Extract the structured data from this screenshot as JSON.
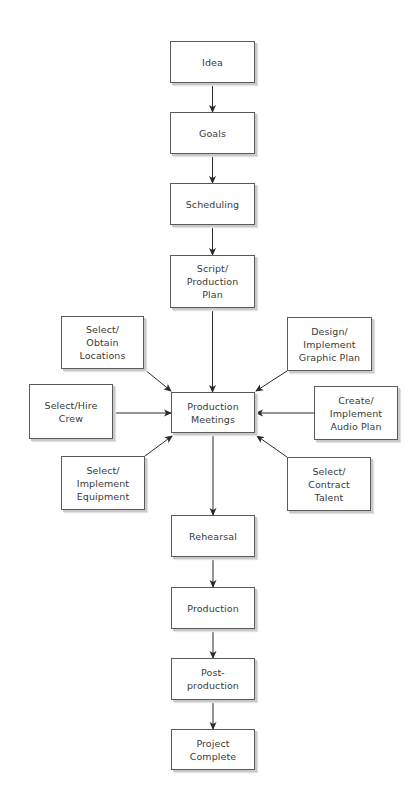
{
  "diagram": {
    "type": "flowchart",
    "colors": {
      "background": "#ffffff",
      "box_border": "#5a5a5a",
      "box_shadow": "#c9c9c9",
      "arrow": "#2a2a2a",
      "text": "#3a3a3a"
    },
    "main_flow": [
      {
        "id": "idea",
        "label": "Idea",
        "x": 170,
        "y": 41,
        "w": 85,
        "h": 42
      },
      {
        "id": "goals",
        "label": "Goals",
        "x": 170,
        "y": 112,
        "w": 85,
        "h": 42
      },
      {
        "id": "scheduling",
        "label": "Scheduling",
        "x": 170,
        "y": 183,
        "w": 85,
        "h": 42
      },
      {
        "id": "script",
        "label": "Script/\nProduction\nPlan",
        "x": 170,
        "y": 255,
        "w": 85,
        "h": 53
      },
      {
        "id": "meetings",
        "label": "Production\nMeetings",
        "x": 171,
        "y": 392,
        "w": 84,
        "h": 41
      },
      {
        "id": "rehearsal",
        "label": "Rehearsal",
        "x": 171,
        "y": 515,
        "w": 84,
        "h": 42
      },
      {
        "id": "production",
        "label": "Production",
        "x": 171,
        "y": 587,
        "w": 84,
        "h": 42
      },
      {
        "id": "postproduction",
        "label": "Post-\nproduction",
        "x": 171,
        "y": 658,
        "w": 84,
        "h": 42
      },
      {
        "id": "complete",
        "label": "Project\nComplete",
        "x": 171,
        "y": 729,
        "w": 84,
        "h": 41
      }
    ],
    "inputs": [
      {
        "id": "locations",
        "label": "Select/\nObtain\nLocations",
        "x": 61,
        "y": 316,
        "w": 83,
        "h": 53
      },
      {
        "id": "crew",
        "label": "Select/Hire\nCrew",
        "x": 29,
        "y": 384,
        "w": 84,
        "h": 55
      },
      {
        "id": "equipment",
        "label": "Select/\nImplement\nEquipment",
        "x": 61,
        "y": 456,
        "w": 84,
        "h": 54
      },
      {
        "id": "graphic",
        "label": "Design/\nImplement\nGraphic Plan",
        "x": 287,
        "y": 317,
        "w": 85,
        "h": 54
      },
      {
        "id": "audio",
        "label": "Create/\nImplement\nAudio Plan",
        "x": 314,
        "y": 386,
        "w": 84,
        "h": 54
      },
      {
        "id": "talent",
        "label": "Select/\nContract\nTalent",
        "x": 287,
        "y": 457,
        "w": 84,
        "h": 54
      }
    ],
    "edges": [
      {
        "from": "idea",
        "to": "goals",
        "x1": 212.5,
        "y1": 83,
        "x2": 212.5,
        "y2": 112
      },
      {
        "from": "goals",
        "to": "scheduling",
        "x1": 212.5,
        "y1": 154,
        "x2": 212.5,
        "y2": 183
      },
      {
        "from": "scheduling",
        "to": "script",
        "x1": 212.5,
        "y1": 225,
        "x2": 212.5,
        "y2": 255
      },
      {
        "from": "script",
        "to": "meetings",
        "x1": 212.5,
        "y1": 308,
        "x2": 212.5,
        "y2": 392
      },
      {
        "from": "locations",
        "to": "meetings",
        "x1": 144,
        "y1": 369,
        "x2": 171,
        "y2": 391
      },
      {
        "from": "crew",
        "to": "meetings",
        "x1": 113,
        "y1": 413,
        "x2": 171,
        "y2": 413
      },
      {
        "from": "equipment",
        "to": "meetings",
        "x1": 145,
        "y1": 456,
        "x2": 172,
        "y2": 436
      },
      {
        "from": "graphic",
        "to": "meetings",
        "x1": 287,
        "y1": 371,
        "x2": 256,
        "y2": 391
      },
      {
        "from": "audio",
        "to": "meetings",
        "x1": 314,
        "y1": 413,
        "x2": 256,
        "y2": 413
      },
      {
        "from": "talent",
        "to": "meetings",
        "x1": 287,
        "y1": 457,
        "x2": 257,
        "y2": 436
      },
      {
        "from": "meetings",
        "to": "rehearsal",
        "x1": 213,
        "y1": 433,
        "x2": 213,
        "y2": 515
      },
      {
        "from": "rehearsal",
        "to": "production",
        "x1": 213,
        "y1": 557,
        "x2": 213,
        "y2": 587
      },
      {
        "from": "production",
        "to": "postproduction",
        "x1": 213,
        "y1": 629,
        "x2": 213,
        "y2": 658
      },
      {
        "from": "postproduction",
        "to": "complete",
        "x1": 213,
        "y1": 700,
        "x2": 213,
        "y2": 729
      }
    ]
  }
}
